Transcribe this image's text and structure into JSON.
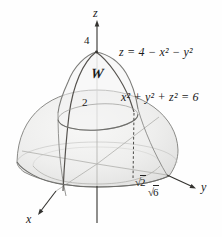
{
  "figure": {
    "axes": {
      "x_label": "x",
      "y_label": "y",
      "z_label": "z"
    },
    "values": {
      "apex": "4",
      "circle": "2"
    },
    "region": {
      "label": "W"
    },
    "equations": {
      "paraboloid": "z = 4 − x² − y²",
      "sphere": "x² + y² + z² = 6"
    },
    "radicals": {
      "sqrt2": {
        "sign": "√",
        "radicand": "2"
      },
      "sqrt6": {
        "sign": "√",
        "radicand": "6"
      }
    },
    "colors": {
      "surface": "#ededec",
      "outline": "#8b8b88",
      "curve": "#55524e",
      "text": "#1a1a1a"
    }
  }
}
